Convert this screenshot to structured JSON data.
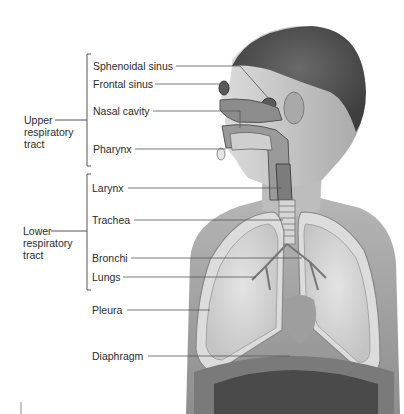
{
  "diagram": {
    "groups": [
      {
        "label_lines": [
          "Upper",
          "respiratory",
          "tract"
        ]
      },
      {
        "label_lines": [
          "Lower",
          "respiratory",
          "tract"
        ]
      }
    ],
    "labels": [
      {
        "text": "Sphenoidal sinus"
      },
      {
        "text": "Frontal sinus"
      },
      {
        "text": "Nasal cavity"
      },
      {
        "text": "Pharynx"
      },
      {
        "text": "Larynx"
      },
      {
        "text": "Trachea"
      },
      {
        "text": "Bronchi"
      },
      {
        "text": "Lungs"
      },
      {
        "text": "Pleura"
      },
      {
        "text": "Diaphragm"
      }
    ]
  }
}
